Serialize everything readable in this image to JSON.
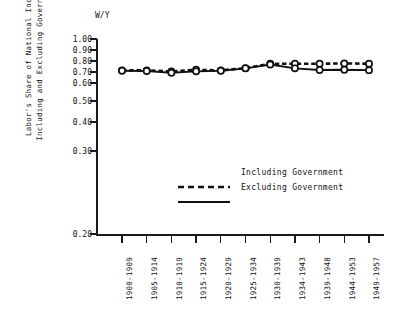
{
  "chart_data": {
    "type": "line",
    "title": "",
    "unit_label": "W/Y",
    "ylabel_line1": "Labor's Share of National Income",
    "ylabel_line2": "Including and Excluding Government",
    "xlabel": "",
    "grid": false,
    "legend_position": "center-right-inside",
    "ylim": [
      0.2,
      1.0
    ],
    "yticks": [
      1.0,
      0.9,
      0.8,
      0.7,
      0.6,
      0.5,
      0.4,
      0.3,
      0.2
    ],
    "ytick_labels": [
      "1.00",
      "0.90",
      "0.80",
      "0.70",
      "0.60",
      "0.50",
      "0.40",
      "0.30",
      "0.20"
    ],
    "ytick_positions_px": [
      0,
      11,
      22,
      33,
      44,
      62,
      83,
      112,
      195
    ],
    "categories": [
      "1900-1909",
      "1905-1914",
      "1910-1919",
      "1915-1924",
      "1920-1929",
      "1925-1934",
      "1930-1939",
      "1934-1943",
      "1939-1948",
      "1944-1953",
      "1949-1957"
    ],
    "series": [
      {
        "name": "Including Government",
        "style": "dashed",
        "marker": "circle",
        "color": "#111111",
        "values": [
          0.715,
          0.715,
          0.705,
          0.72,
          0.715,
          0.735,
          0.775,
          0.775,
          0.775,
          0.778,
          0.775
        ]
      },
      {
        "name": "Excluding Government",
        "style": "solid",
        "marker": "circle",
        "color": "#111111",
        "values": [
          0.712,
          0.708,
          0.693,
          0.706,
          0.712,
          0.733,
          0.768,
          0.733,
          0.718,
          0.72,
          0.717
        ]
      }
    ],
    "legend": [
      {
        "label": "Including Government",
        "style": "dashed"
      },
      {
        "label": "Excluding Government",
        "style": "solid"
      }
    ]
  }
}
